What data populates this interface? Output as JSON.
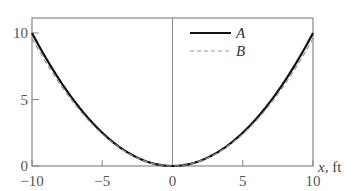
{
  "chart_data": {
    "type": "line",
    "title": "",
    "xlabel": "x, ft",
    "ylabel": "",
    "xlim": [
      -10,
      10
    ],
    "ylim": [
      0,
      11.2
    ],
    "xticks": [
      -10,
      -5,
      0,
      5,
      10
    ],
    "xtick_labels": [
      "−10",
      "−5",
      "0",
      "5",
      "10"
    ],
    "yticks": [
      0,
      5,
      10
    ],
    "ytick_labels": [
      "0",
      "5",
      "10"
    ],
    "grid": false,
    "legend_position": "upper right",
    "series": [
      {
        "name": "A",
        "style": "solid",
        "color": "#111111",
        "x": [
          -10,
          -8,
          -6,
          -4,
          -2,
          0,
          2,
          4,
          6,
          8,
          10
        ],
        "y": [
          10.0,
          6.4,
          3.6,
          1.6,
          0.4,
          0.0,
          0.4,
          1.6,
          3.6,
          6.4,
          10.0
        ]
      },
      {
        "name": "B",
        "style": "dashed",
        "color": "#999999",
        "x": [
          -10,
          -8,
          -6,
          -4,
          -2,
          0,
          2,
          4,
          6,
          8,
          10
        ],
        "y": [
          9.6,
          6.0,
          3.3,
          1.4,
          0.3,
          0.0,
          0.3,
          1.4,
          3.3,
          6.0,
          9.6
        ]
      }
    ]
  },
  "legend": {
    "a": "A",
    "b": "B"
  },
  "axis": {
    "x_title": "x, ft"
  }
}
